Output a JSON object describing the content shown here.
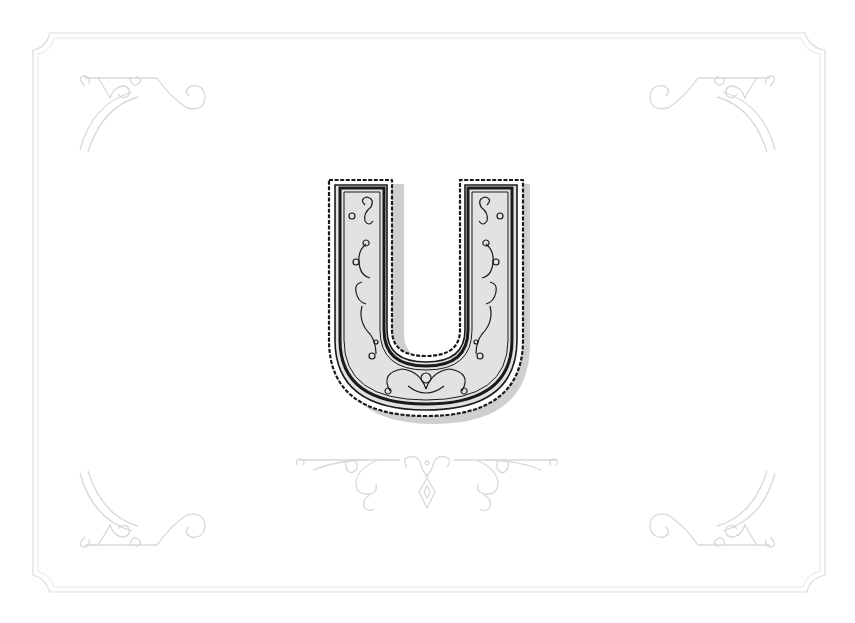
{
  "artwork": {
    "letter": "U",
    "description": "Ornamental monogram letter U on decorative framed card",
    "colors": {
      "background": "#ffffff",
      "frame": "#dcdcdc",
      "ornament": "#d8d8d8",
      "letter_fill": "#e2e2e2",
      "letter_stroke": "#1a1a1a",
      "letter_shadow": "#cfcfcf"
    }
  }
}
